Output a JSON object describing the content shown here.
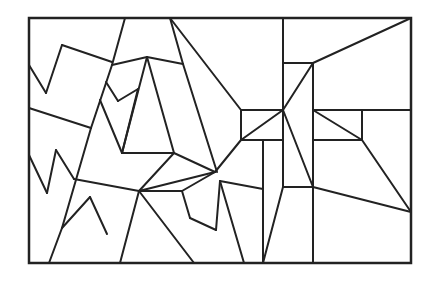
{
  "diagram": {
    "type": "geometric-line-puzzle",
    "background": "#ffffff",
    "stroke_color": "#222222",
    "frame": {
      "x": 29,
      "y": 18,
      "width": 382,
      "height": 245
    },
    "lines": [
      [
        29,
        65,
        46,
        93
      ],
      [
        46,
        93,
        62,
        45
      ],
      [
        62,
        45,
        112,
        62
      ],
      [
        29,
        108,
        91,
        128
      ],
      [
        125,
        18,
        112,
        65
      ],
      [
        112,
        65,
        91,
        128
      ],
      [
        91,
        128,
        62,
        228
      ],
      [
        62,
        228,
        49,
        263
      ],
      [
        112,
        65,
        147,
        57
      ],
      [
        147,
        57,
        183,
        64
      ],
      [
        106,
        82,
        118,
        101
      ],
      [
        118,
        101,
        138,
        89
      ],
      [
        138,
        89,
        122,
        153
      ],
      [
        100,
        100,
        122,
        153
      ],
      [
        147,
        57,
        122,
        153
      ],
      [
        122,
        153,
        174,
        153
      ],
      [
        147,
        57,
        174,
        153
      ],
      [
        170,
        18,
        183,
        64
      ],
      [
        183,
        64,
        217,
        172
      ],
      [
        170,
        18,
        241,
        110
      ],
      [
        29,
        155,
        47,
        193
      ],
      [
        47,
        193,
        56,
        150
      ],
      [
        56,
        150,
        74,
        179
      ],
      [
        74,
        179,
        139,
        191
      ],
      [
        139,
        191,
        174,
        153
      ],
      [
        139,
        191,
        215,
        172
      ],
      [
        215,
        172,
        241,
        140
      ],
      [
        174,
        153,
        215,
        172
      ],
      [
        139,
        191,
        182,
        191
      ],
      [
        182,
        191,
        215,
        172
      ],
      [
        139,
        191,
        120,
        263
      ],
      [
        62,
        228,
        90,
        197
      ],
      [
        90,
        197,
        107,
        234
      ],
      [
        139,
        191,
        194,
        263
      ],
      [
        182,
        191,
        190,
        218
      ],
      [
        190,
        218,
        216,
        230
      ],
      [
        216,
        230,
        220,
        181
      ],
      [
        220,
        181,
        263,
        189
      ],
      [
        220,
        181,
        244,
        263
      ],
      [
        241,
        110,
        283,
        110
      ],
      [
        241,
        110,
        241,
        140
      ],
      [
        241,
        140,
        283,
        140
      ],
      [
        241,
        140,
        283,
        110
      ],
      [
        263,
        140,
        263,
        263
      ],
      [
        263,
        263,
        283,
        187
      ],
      [
        283,
        18,
        283,
        187
      ],
      [
        283,
        187,
        313,
        187
      ],
      [
        283,
        63,
        313,
        63
      ],
      [
        313,
        63,
        411,
        18
      ],
      [
        313,
        63,
        313,
        263
      ],
      [
        283,
        110,
        313,
        63
      ],
      [
        283,
        110,
        313,
        187
      ],
      [
        313,
        110,
        411,
        110
      ],
      [
        313,
        110,
        362,
        140
      ],
      [
        313,
        140,
        362,
        140
      ],
      [
        362,
        110,
        362,
        140
      ],
      [
        362,
        140,
        411,
        212
      ],
      [
        313,
        187,
        411,
        212
      ]
    ]
  }
}
